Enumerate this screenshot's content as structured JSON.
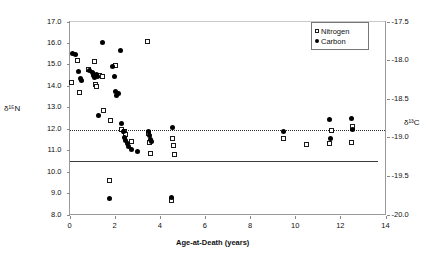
{
  "chart_data": {
    "type": "scatter",
    "title": "",
    "xlabel": "Age-at-Death (years)",
    "ylabel_left": "δ¹⁵N",
    "ylabel_right": "δ¹³C",
    "xlim": [
      0,
      14
    ],
    "xticks": [
      "0",
      "2",
      "4",
      "6",
      "8",
      "10",
      "12",
      "14"
    ],
    "xtick_values": [
      0,
      2,
      4,
      6,
      8,
      10,
      12,
      14
    ],
    "ylim_left": [
      8.0,
      17.0
    ],
    "yticks_left": [
      "8.0",
      "9.0",
      "10.0",
      "11.0",
      "12.0",
      "13.0",
      "14.0",
      "15.0",
      "16.0",
      "17.0"
    ],
    "ytick_values_left": [
      8.0,
      9.0,
      10.0,
      11.0,
      12.0,
      13.0,
      14.0,
      15.0,
      16.0,
      17.0
    ],
    "ylim_right": [
      -20.0,
      -17.5
    ],
    "yticks_right": [
      "-17.5",
      "-18.0",
      "-18.5",
      "-19.0",
      "-19.5",
      "-20.0"
    ],
    "ytick_values_right": [
      -17.5,
      -18.0,
      -18.5,
      -19.0,
      -19.5,
      -20.0
    ],
    "grid": false,
    "legend_position": "top-right",
    "legend": [
      {
        "name": "Nitrogen",
        "marker": "open-square",
        "color": "#ffffff"
      },
      {
        "name": "Carbon",
        "marker": "filled-circle",
        "color": "#000000"
      }
    ],
    "series": [
      {
        "name": "Nitrogen",
        "marker": "open-square",
        "axis": "left",
        "points": [
          [
            0.1,
            14.15
          ],
          [
            0.35,
            15.2
          ],
          [
            0.45,
            13.7
          ],
          [
            0.85,
            14.75
          ],
          [
            1.1,
            15.15
          ],
          [
            1.15,
            14.05
          ],
          [
            1.2,
            13.95
          ],
          [
            1.35,
            14.5
          ],
          [
            1.45,
            14.45
          ],
          [
            1.5,
            12.85
          ],
          [
            1.75,
            9.6
          ],
          [
            1.8,
            12.4
          ],
          [
            2.05,
            14.95
          ],
          [
            2.3,
            11.95
          ],
          [
            2.45,
            11.85
          ],
          [
            2.5,
            11.75
          ],
          [
            2.75,
            11.4
          ],
          [
            3.45,
            16.05
          ],
          [
            3.5,
            11.8
          ],
          [
            3.55,
            11.35
          ],
          [
            3.6,
            10.85
          ],
          [
            4.5,
            8.65
          ],
          [
            4.55,
            11.55
          ],
          [
            4.6,
            11.2
          ],
          [
            4.65,
            10.8
          ],
          [
            9.5,
            11.55
          ],
          [
            10.5,
            11.25
          ],
          [
            11.5,
            11.3
          ],
          [
            11.6,
            11.9
          ],
          [
            12.5,
            11.35
          ],
          [
            12.55,
            12.1
          ]
        ]
      },
      {
        "name": "Carbon",
        "marker": "filled-circle",
        "axis": "right",
        "points": [
          [
            0.15,
            15.5
          ],
          [
            0.25,
            15.45
          ],
          [
            0.4,
            14.65
          ],
          [
            0.5,
            14.35
          ],
          [
            0.55,
            14.25
          ],
          [
            0.9,
            14.7
          ],
          [
            1.0,
            14.6
          ],
          [
            1.05,
            14.5
          ],
          [
            1.1,
            14.4
          ],
          [
            1.2,
            14.55
          ],
          [
            1.25,
            14.45
          ],
          [
            1.3,
            12.6
          ],
          [
            1.45,
            16.0
          ],
          [
            1.75,
            8.75
          ],
          [
            1.9,
            14.9
          ],
          [
            2.0,
            14.45
          ],
          [
            2.05,
            13.75
          ],
          [
            2.1,
            13.55
          ],
          [
            2.15,
            13.65
          ],
          [
            2.25,
            15.65
          ],
          [
            2.3,
            12.25
          ],
          [
            2.4,
            11.85
          ],
          [
            2.45,
            11.6
          ],
          [
            2.5,
            11.45
          ],
          [
            2.55,
            11.3
          ],
          [
            2.6,
            11.15
          ],
          [
            2.75,
            11.05
          ],
          [
            3.0,
            10.95
          ],
          [
            3.5,
            11.85
          ],
          [
            3.55,
            11.7
          ],
          [
            3.6,
            11.5
          ],
          [
            3.65,
            11.4
          ],
          [
            4.5,
            8.8
          ],
          [
            4.55,
            12.05
          ],
          [
            9.5,
            11.85
          ],
          [
            11.5,
            12.45
          ],
          [
            11.55,
            11.55
          ],
          [
            12.5,
            12.5
          ],
          [
            12.55,
            11.95
          ]
        ]
      }
    ],
    "trendlines": [
      {
        "name": "carbon-trend-dotted",
        "style": "dotted",
        "y_left_value": 11.95,
        "color": "#2a2a2a"
      },
      {
        "name": "nitrogen-trend-solid",
        "style": "solid",
        "y_left_value": 10.5,
        "color": "#3a3a3a"
      }
    ]
  }
}
